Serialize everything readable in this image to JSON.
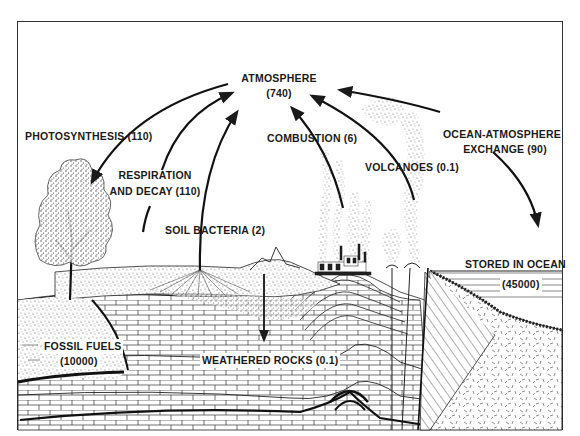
{
  "reservoirs": {
    "atmosphere": {
      "label": "ATMOSPHERE",
      "value": "(740)"
    },
    "fossil_fuels": {
      "label": "FOSSIL FUELS",
      "value": "(10000)"
    },
    "ocean": {
      "label": "STORED IN OCEAN",
      "value": "(45000)"
    }
  },
  "fluxes": {
    "photosynthesis": "PHOTOSYNTHESIS (110)",
    "respiration_line1": "RESPIRATION",
    "respiration_line2": "AND DECAY (110)",
    "soil_bacteria": "SOIL BACTERIA (2)",
    "combustion": "COMBUSTION (6)",
    "volcanoes": "VOLCANOES (0.1)",
    "ocean_exchange_line1": "OCEAN-ATMOSPHERE",
    "ocean_exchange_line2": "EXCHANGE (90)",
    "weathered_rocks": "WEATHERED ROCKS (0.1)"
  },
  "colors": {
    "ink": "#1a1a1a",
    "paper": "#ffffff",
    "frame": "#333333"
  }
}
